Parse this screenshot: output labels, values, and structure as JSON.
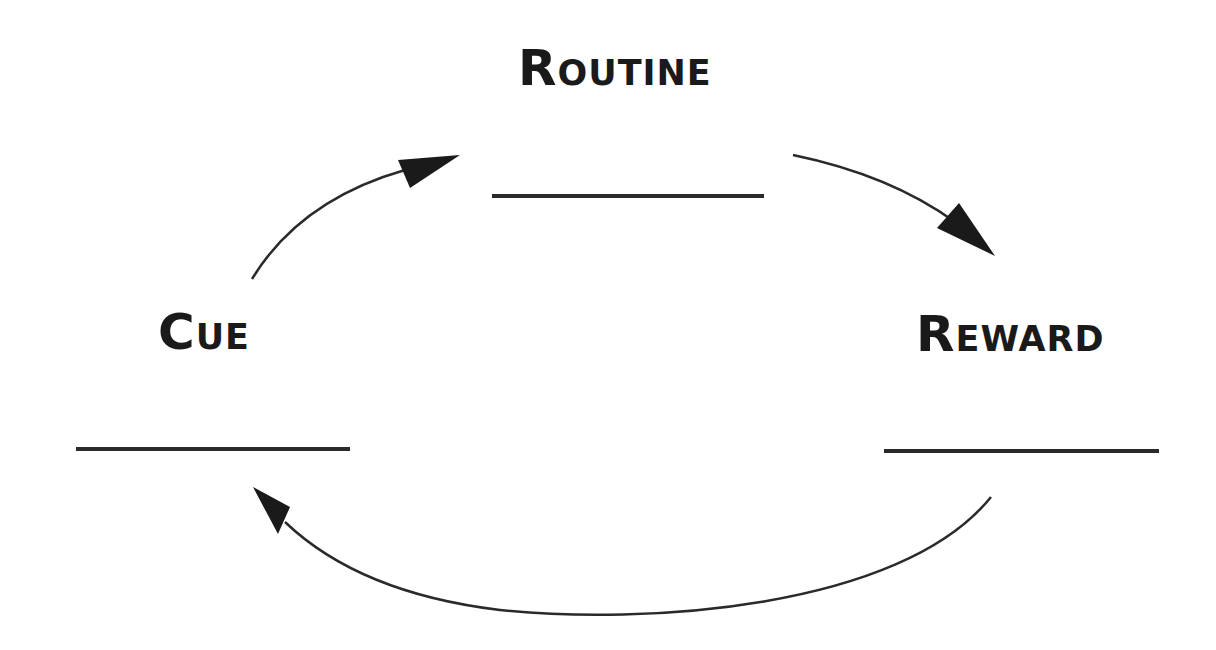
{
  "diagram": {
    "nodes": [
      {
        "id": "routine",
        "label": "Routine",
        "blank_line": true
      },
      {
        "id": "cue",
        "label": "Cue",
        "blank_line": true
      },
      {
        "id": "reward",
        "label": "Reward",
        "blank_line": true
      }
    ],
    "edges": [
      {
        "from": "cue",
        "to": "routine"
      },
      {
        "from": "routine",
        "to": "reward"
      },
      {
        "from": "reward",
        "to": "cue"
      }
    ],
    "colors": {
      "background": "#ffffff",
      "text": "#1a1a1a",
      "stroke": "#2a2a2a"
    }
  }
}
